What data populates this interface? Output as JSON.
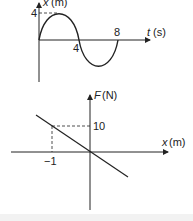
{
  "graph_top": {
    "y_axis_label_var": "x",
    "y_axis_label_unit": "(m)",
    "x_axis_label_var": "t",
    "x_axis_label_unit": "(s)",
    "y_tick": "4",
    "x_ticks": [
      "4",
      "8"
    ]
  },
  "graph_bottom": {
    "y_axis_label_var": "F",
    "y_axis_label_unit": "(N)",
    "x_axis_label_var": "x",
    "x_axis_label_unit": "(m)",
    "y_tick": "10",
    "x_tick": "−1"
  },
  "colors": {
    "line": "#222222",
    "background": "#ffffff"
  }
}
